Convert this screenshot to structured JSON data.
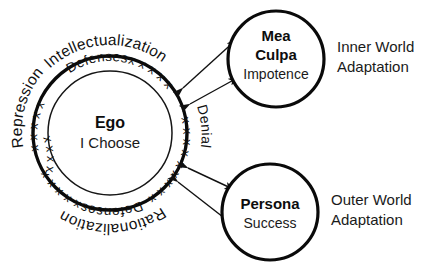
{
  "diagram": {
    "background_color": "#ffffff",
    "ink_color": "#0a0a0a"
  },
  "ego": {
    "title": "Ego",
    "subtitle": "I Choose",
    "ring_label_top": "Defenses",
    "ring_label_bottom": "Defenses",
    "ring_x_marks_top": "x x x x x",
    "ring_x_marks_top_right": "x x x x x",
    "ring_x_marks_bottom": "x x x x x",
    "ring_x_marks_bottom_right": "x x x x x"
  },
  "outer_labels": {
    "top": "Intellectualization",
    "left": "Repression",
    "bottom": "Rationalization",
    "right": "Denial"
  },
  "nodes": [
    {
      "id": "mea-culpa",
      "title_line1": "Mea",
      "title_line2": "Culpa",
      "subtitle": "Impotence",
      "side_label_line1": "Inner World",
      "side_label_line2": "Adaptation"
    },
    {
      "id": "persona",
      "title_line1": "Persona",
      "title_line2": "",
      "subtitle": "Success",
      "side_label_line1": "Outer World",
      "side_label_line2": "Adaptation"
    }
  ],
  "connectors": [
    {
      "id": "ego-mea-culpa",
      "label": "Denial",
      "style": "double-arrow"
    },
    {
      "id": "ego-persona",
      "label": "Denial",
      "style": "double-arrow"
    }
  ]
}
